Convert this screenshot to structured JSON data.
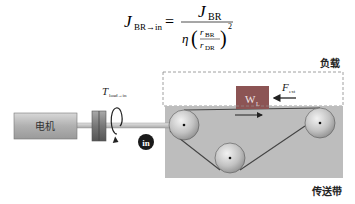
{
  "formula": {
    "lhs_symbol": "J",
    "lhs_subscript": "BR→in",
    "equals": "=",
    "numerator_symbol": "J",
    "numerator_subscript": "BR",
    "eta": "η",
    "ratio_num_symbol": "r",
    "ratio_num_subscript": "BR",
    "ratio_den_symbol": "r",
    "ratio_den_subscript": "DR",
    "exponent": "2"
  },
  "labels": {
    "load": "负载",
    "conveyor": "传送带",
    "motor": "电机",
    "torque_symbol": "T",
    "torque_subscript": "load→in",
    "input_marker": "in",
    "weight_symbol": "W",
    "weight_subscript": "L",
    "force_symbol": "F",
    "force_subscript": "ext"
  },
  "colors": {
    "conveyor_bg": "#bdbdbd",
    "load_box": "#8c5454",
    "motor_fill": "#b8b8b8",
    "belt": "#444444",
    "input_marker_bg": "#1a1a1a"
  }
}
